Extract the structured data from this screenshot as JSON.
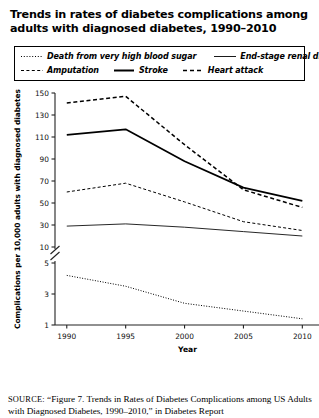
{
  "title": "Trends in rates of diabetes complications among adults with diagnosed diabetes, 1990–2010",
  "legend": {
    "items": [
      {
        "label": "Death from very high blood sugar",
        "style": "dotted",
        "color": "#000000"
      },
      {
        "label": "End-stage renal disease",
        "style": "solid-thin",
        "color": "#000000"
      },
      {
        "label": "Amputation",
        "style": "dashed-fine",
        "color": "#000000"
      },
      {
        "label": "Stroke",
        "style": "solid-thick",
        "color": "#000000"
      },
      {
        "label": "Heart attack",
        "style": "dashed-bold",
        "color": "#000000"
      }
    ]
  },
  "source": {
    "prefix": "SOURCE:",
    "text": "“Figure 7. Trends in Rates of Diabetes Complications among",
    "line2": "US Adults with Diagnosed Diabetes, 1990–2010,” in Diabetes Report"
  },
  "chart_data": {
    "type": "line",
    "title": "Trends in rates of diabetes complications among adults with diagnosed diabetes, 1990–2010",
    "xlabel": "Year",
    "ylabel": "Complications per 10,000 adults with diagnosed diabetes",
    "x": [
      1990,
      1995,
      2000,
      2005,
      2010
    ],
    "xticks": [
      "1990",
      "1995",
      "2000",
      "2005",
      "2010"
    ],
    "xlim": [
      1989,
      2011.5
    ],
    "yticks_upper": [
      10,
      30,
      50,
      70,
      90,
      110,
      130,
      150
    ],
    "yticks_lower": [
      1,
      3,
      5
    ],
    "ylim_upper": [
      10,
      150
    ],
    "ylim_lower": [
      1,
      5
    ],
    "axis_break": true,
    "grid": false,
    "legend_position": "above-plot",
    "series": [
      {
        "name": "Heart attack",
        "style": "dashed-bold",
        "values": [
          141,
          147,
          103,
          62,
          46
        ]
      },
      {
        "name": "Stroke",
        "style": "solid-thick",
        "values": [
          112,
          117,
          88,
          64,
          52
        ]
      },
      {
        "name": "Amputation",
        "style": "dashed-fine",
        "values": [
          60,
          68,
          51,
          33,
          25
        ]
      },
      {
        "name": "End-stage renal disease",
        "style": "solid-thin",
        "values": [
          29,
          31,
          28,
          24,
          20
        ]
      },
      {
        "name": "Death from very high blood sugar",
        "style": "dotted",
        "values": [
          4.2,
          3.5,
          2.4,
          1.9,
          1.4
        ]
      }
    ]
  }
}
